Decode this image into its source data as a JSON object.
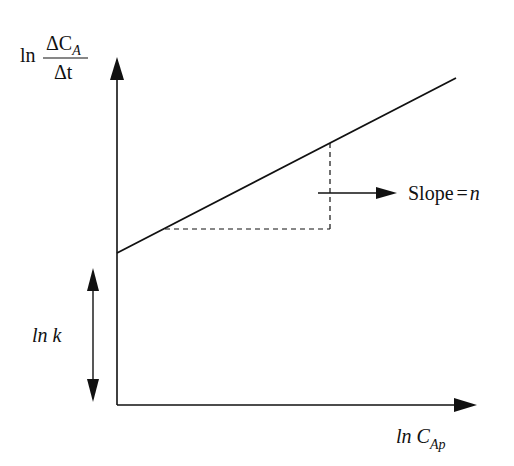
{
  "diagram": {
    "type": "log-log rate plot",
    "y_axis": {
      "label_prefix": "ln",
      "numerator": "ΔC",
      "numerator_sub": "A",
      "denominator": "Δt"
    },
    "x_axis": {
      "label_main": "ln C",
      "label_sub": "Ap"
    },
    "intercept_label": "ln k",
    "slope_label_text": "Slope",
    "slope_label_eq": "=",
    "slope_label_var": "n",
    "colors": {
      "line": "#111111",
      "background": "#ffffff"
    }
  }
}
